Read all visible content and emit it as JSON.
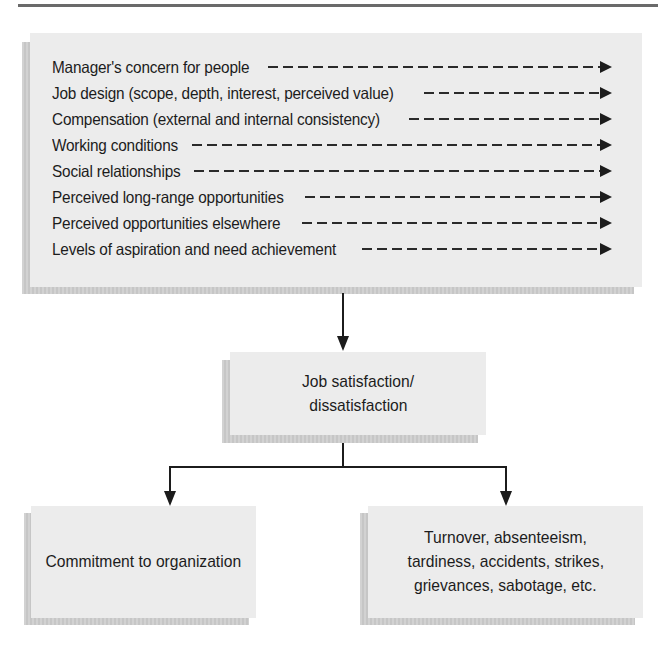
{
  "diagram": {
    "title": "",
    "factors": [
      "Manager's concern for people",
      "Job design (scope, depth, interest, perceived value)",
      "Compensation (external and internal consistency)",
      "Working conditions",
      "Social relationships",
      "Perceived long-range opportunities",
      "Perceived opportunities elsewhere",
      "Levels of aspiration and need achievement"
    ],
    "central_node": {
      "line1": "Job satisfaction/",
      "line2": "dissatisfaction"
    },
    "outcomes": {
      "left": {
        "text": "Commitment to organization"
      },
      "right": {
        "line1": "Turnover, absenteeism,",
        "line2": "tardiness, accidents, strikes,",
        "line3": "grievances, sabotage, etc."
      }
    },
    "edges": [
      {
        "from": "factors",
        "to": "central_node",
        "style": "solid-arrow"
      },
      {
        "from": "central_node",
        "to": "outcomes.left",
        "style": "solid-arrow"
      },
      {
        "from": "central_node",
        "to": "outcomes.right",
        "style": "solid-arrow"
      }
    ],
    "colors": {
      "box_fill": "#ececec",
      "shadow": "#cccccc",
      "line": "#1c1c1c",
      "rule": "#6a6a6a"
    }
  }
}
